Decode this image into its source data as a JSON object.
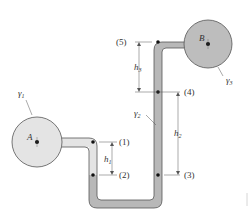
{
  "diagram": {
    "type": "manometer",
    "tanks": [
      {
        "id": "A",
        "label": "A",
        "fluid": "γ1",
        "color": "#e4e4e4"
      },
      {
        "id": "B",
        "label": "B",
        "fluid": "γ3",
        "color": "#bdbdbd"
      }
    ],
    "points": [
      {
        "id": "1",
        "label": "(1)"
      },
      {
        "id": "2",
        "label": "(2)"
      },
      {
        "id": "3",
        "label": "(3)"
      },
      {
        "id": "4",
        "label": "(4)"
      },
      {
        "id": "5",
        "label": "(5)"
      }
    ],
    "heights": [
      {
        "id": "h1",
        "base": "h",
        "sub": "1"
      },
      {
        "id": "h2",
        "base": "h",
        "sub": "2"
      },
      {
        "id": "h3",
        "base": "h",
        "sub": "3"
      }
    ],
    "fluids": [
      {
        "id": "g1",
        "base": "γ",
        "sub": "1"
      },
      {
        "id": "g2",
        "base": "γ",
        "sub": "2"
      },
      {
        "id": "g3",
        "base": "γ",
        "sub": "3"
      }
    ],
    "colors": {
      "fluid1": "#e4e4e4",
      "fluid2": "#b8b8b8",
      "fluid3": "#bdbdbd",
      "outline": "#555555"
    }
  }
}
